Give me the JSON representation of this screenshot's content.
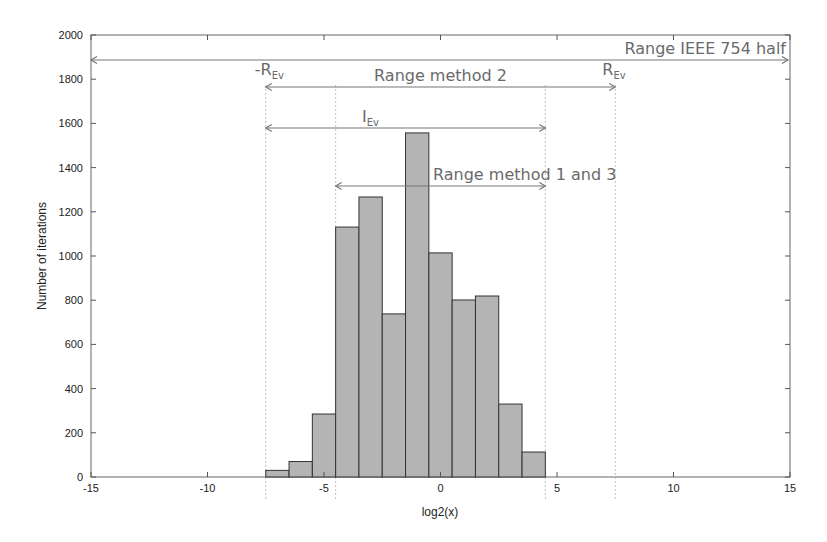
{
  "chart_data": {
    "type": "bar",
    "subtype": "histogram",
    "title": "",
    "xlabel": "log2(x)",
    "ylabel": "Number of iterations",
    "xlim": [
      -15,
      15
    ],
    "ylim": [
      0,
      2000
    ],
    "xticks": [
      -15,
      -10,
      -5,
      0,
      5,
      10,
      15
    ],
    "yticks": [
      0,
      200,
      400,
      600,
      800,
      1000,
      1200,
      1400,
      1600,
      1800,
      2000
    ],
    "bin_width": 1,
    "categories": [
      -7,
      -6,
      -5,
      -4,
      -3,
      -2,
      -1,
      0,
      1,
      2,
      3,
      4
    ],
    "values": [
      30,
      70,
      285,
      1131,
      1267,
      738,
      1557,
      1014,
      801,
      819,
      330,
      113
    ],
    "bar_color": "#b4b4b4",
    "bar_edge_color": "#333333",
    "grid": false,
    "annotations": [
      {
        "label": "Range IEEE 754 half",
        "x_start": -15,
        "x_end": 15,
        "y": 1890
      },
      {
        "label": "Range method 2",
        "x_start": -7.5,
        "x_end": 7.5,
        "y": 1760
      },
      {
        "label": "I",
        "sub": "Ev",
        "x_start": -7.5,
        "x_end": 4.5,
        "y": 1575
      },
      {
        "label": "Range method 1 and 3",
        "x_start": -4.5,
        "x_end": 4.5,
        "y": 1320
      }
    ],
    "marker_labels": [
      {
        "label": "-R",
        "sub": "Ev",
        "x": -7.5
      },
      {
        "label": "R",
        "sub": "Ev",
        "x": 7.5
      }
    ],
    "vertical_dotted_lines": [
      -7.5,
      -4.5,
      4.5,
      7.5
    ]
  }
}
